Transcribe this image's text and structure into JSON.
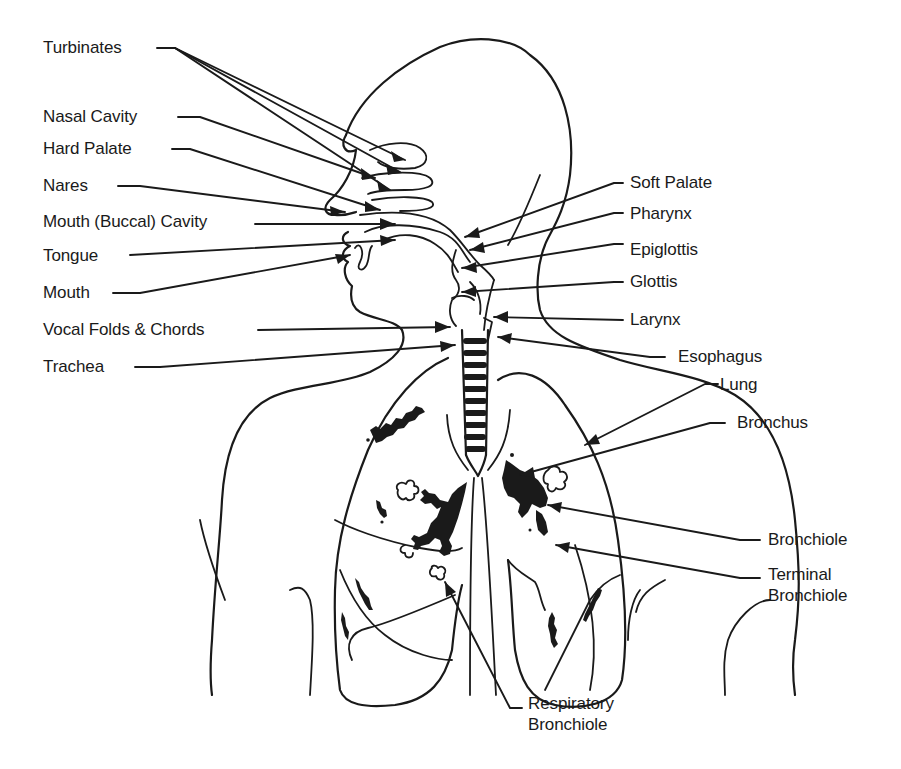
{
  "figure": {
    "colors": {
      "ink": "#1a1a1a",
      "background": "#ffffff"
    }
  },
  "labels": {
    "left": [
      {
        "id": "turbinates",
        "text": "Turbinates"
      },
      {
        "id": "nasal-cavity",
        "text": "Nasal Cavity"
      },
      {
        "id": "hard-palate",
        "text": "Hard Palate"
      },
      {
        "id": "nares",
        "text": "Nares"
      },
      {
        "id": "mouth-buccal-cavity",
        "text": "Mouth (Buccal) Cavity"
      },
      {
        "id": "tongue",
        "text": "Tongue"
      },
      {
        "id": "mouth",
        "text": "Mouth"
      },
      {
        "id": "vocal-folds",
        "text": "Vocal Folds & Chords"
      },
      {
        "id": "trachea",
        "text": "Trachea"
      }
    ],
    "right": [
      {
        "id": "soft-palate",
        "text": "Soft Palate"
      },
      {
        "id": "pharynx",
        "text": "Pharynx"
      },
      {
        "id": "epiglottis",
        "text": "Epiglottis"
      },
      {
        "id": "glottis",
        "text": "Glottis"
      },
      {
        "id": "larynx",
        "text": "Larynx"
      },
      {
        "id": "esophagus",
        "text": "Esophagus"
      },
      {
        "id": "lung",
        "text": "Lung"
      },
      {
        "id": "bronchus",
        "text": "Bronchus"
      },
      {
        "id": "bronchiole",
        "text": "Bronchiole"
      },
      {
        "id": "terminal-bronchiole",
        "lines": [
          "Terminal",
          "Bronchiole"
        ]
      }
    ],
    "bottom": [
      {
        "id": "respiratory-bronchiole",
        "lines": [
          "Respiratory",
          "Bronchiole"
        ]
      }
    ]
  }
}
